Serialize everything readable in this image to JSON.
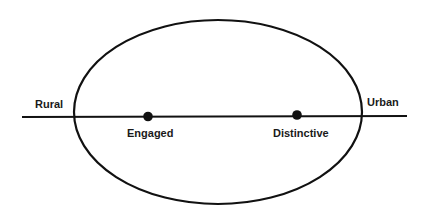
{
  "diagram": {
    "axis": {
      "left_label": "Rural",
      "right_label": "Urban"
    },
    "points": [
      {
        "label": "Engaged"
      },
      {
        "label": "Distinctive"
      }
    ],
    "colors": {
      "stroke": "#111111",
      "background": "#ffffff"
    }
  }
}
